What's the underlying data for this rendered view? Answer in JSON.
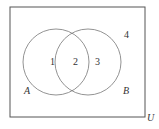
{
  "diagram": {
    "type": "venn",
    "universe_label": "U",
    "sets": [
      {
        "name": "A",
        "label": "A"
      },
      {
        "name": "B",
        "label": "B"
      }
    ],
    "regions": [
      {
        "id": "1",
        "label": "1",
        "description": "A only"
      },
      {
        "id": "2",
        "label": "2",
        "description": "A and B"
      },
      {
        "id": "3",
        "label": "3",
        "description": "B only"
      },
      {
        "id": "4",
        "label": "4",
        "description": "outside A and B"
      }
    ],
    "colors": {
      "stroke": "#555555",
      "text": "#333333",
      "background": "#ffffff"
    }
  }
}
